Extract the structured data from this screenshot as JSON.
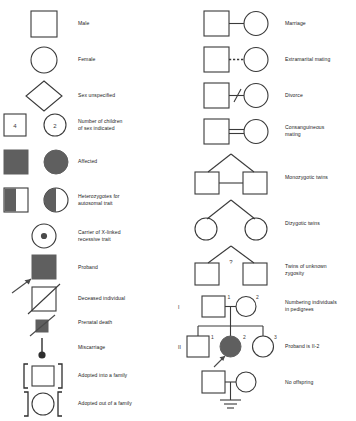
{
  "legend": {
    "title": "Pedigree symbols legend",
    "fill_color": "#5f5f5f",
    "stroke_color": "#3a3a3a",
    "background": "#ffffff",
    "left_column": [
      {
        "key": "male",
        "label": "Male",
        "symbol": "square-open"
      },
      {
        "key": "female",
        "label": "Female",
        "symbol": "circle-open"
      },
      {
        "key": "sex-unspecified",
        "label": "Sex unspecified",
        "symbol": "diamond-open"
      },
      {
        "key": "number-of-children",
        "label": "Number of children\nof sex indicated",
        "symbol": "square-and-circle-numbered",
        "square_value": "4",
        "circle_value": "2"
      },
      {
        "key": "affected",
        "label": "Affected",
        "symbol": "square-and-circle-filled"
      },
      {
        "key": "heterozygotes",
        "label": "Heterozygotes for\nautosomal trait",
        "symbol": "square-and-circle-half-filled"
      },
      {
        "key": "carrier-x-linked",
        "label": "Carrier of X-linked\nrecessive trait",
        "symbol": "circle-with-center-dot"
      },
      {
        "key": "proband",
        "label": "Proband",
        "symbol": "filled-square-with-arrow"
      },
      {
        "key": "deceased",
        "label": "Deceased individual",
        "symbol": "square-with-slash"
      },
      {
        "key": "prenatal-death",
        "label": "Prenatal death",
        "symbol": "small-filled-square-with-slash"
      },
      {
        "key": "miscarriage",
        "label": "Miscarriage",
        "symbol": "stem-with-filled-dot"
      },
      {
        "key": "adopted-into",
        "label": "Adopted into a family",
        "symbol": "square-in-brackets"
      },
      {
        "key": "adopted-out",
        "label": "Adopted out of a family",
        "symbol": "circle-in-reversed-brackets"
      }
    ],
    "right_column": [
      {
        "key": "marriage",
        "label": "Marriage",
        "symbol": "couple-solid-line"
      },
      {
        "key": "extramarital-mating",
        "label": "Extramarital mating",
        "symbol": "couple-dashed-line"
      },
      {
        "key": "divorce",
        "label": "Divorce",
        "symbol": "couple-line-with-slash"
      },
      {
        "key": "consanguineous-mating",
        "label": "Consanguineous\nmating",
        "symbol": "couple-double-line"
      },
      {
        "key": "monozygotic-twins",
        "label": "Monozygotic twins",
        "symbol": "twins-squares-joined"
      },
      {
        "key": "dizygotic-twins",
        "label": "Dizygotic twins",
        "symbol": "twins-circles-separate"
      },
      {
        "key": "twins-unknown-zygosity",
        "label": "Twins of unknown\nzygosity",
        "symbol": "twins-squares-question",
        "marker": "?"
      },
      {
        "key": "numbering-individuals",
        "label": "Numbering individuals\nin pedigrees",
        "symbol": "pedigree-numbering"
      },
      {
        "key": "proband-is",
        "label": "Proband is II-2",
        "symbol": "pedigree-proband-row"
      },
      {
        "key": "no-offspring",
        "label": "No offspring",
        "symbol": "couple-no-offspring"
      }
    ],
    "pedigree": {
      "generation_1_label": "I",
      "generation_2_label": "II",
      "gen1_male_number": "1",
      "gen1_female_number": "2",
      "gen2_male_number": "1",
      "gen2_proband_number": "2",
      "gen2_female_number": "3"
    }
  }
}
